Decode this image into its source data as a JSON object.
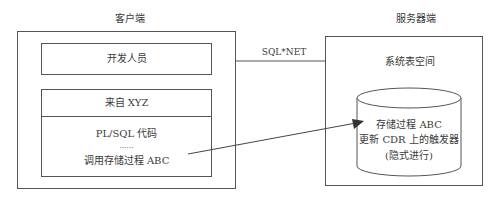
{
  "client": {
    "title": "客户端",
    "developer_box": "开发人员",
    "source_header": "来自 XYZ",
    "code_line": "PL/SQL 代码",
    "ellipsis": "……",
    "call_line": "调用存储过程 ABC"
  },
  "connection": {
    "label": "SQL*NET"
  },
  "server": {
    "title": "服务器端",
    "tablespace": "系统表空间",
    "db_line1": "存储过程 ABC",
    "db_line2": "更新 CDR 上的触发器",
    "db_line3": "(隐式进行)"
  },
  "colors": {
    "stroke": "#555555",
    "text": "#3a3a3a"
  }
}
